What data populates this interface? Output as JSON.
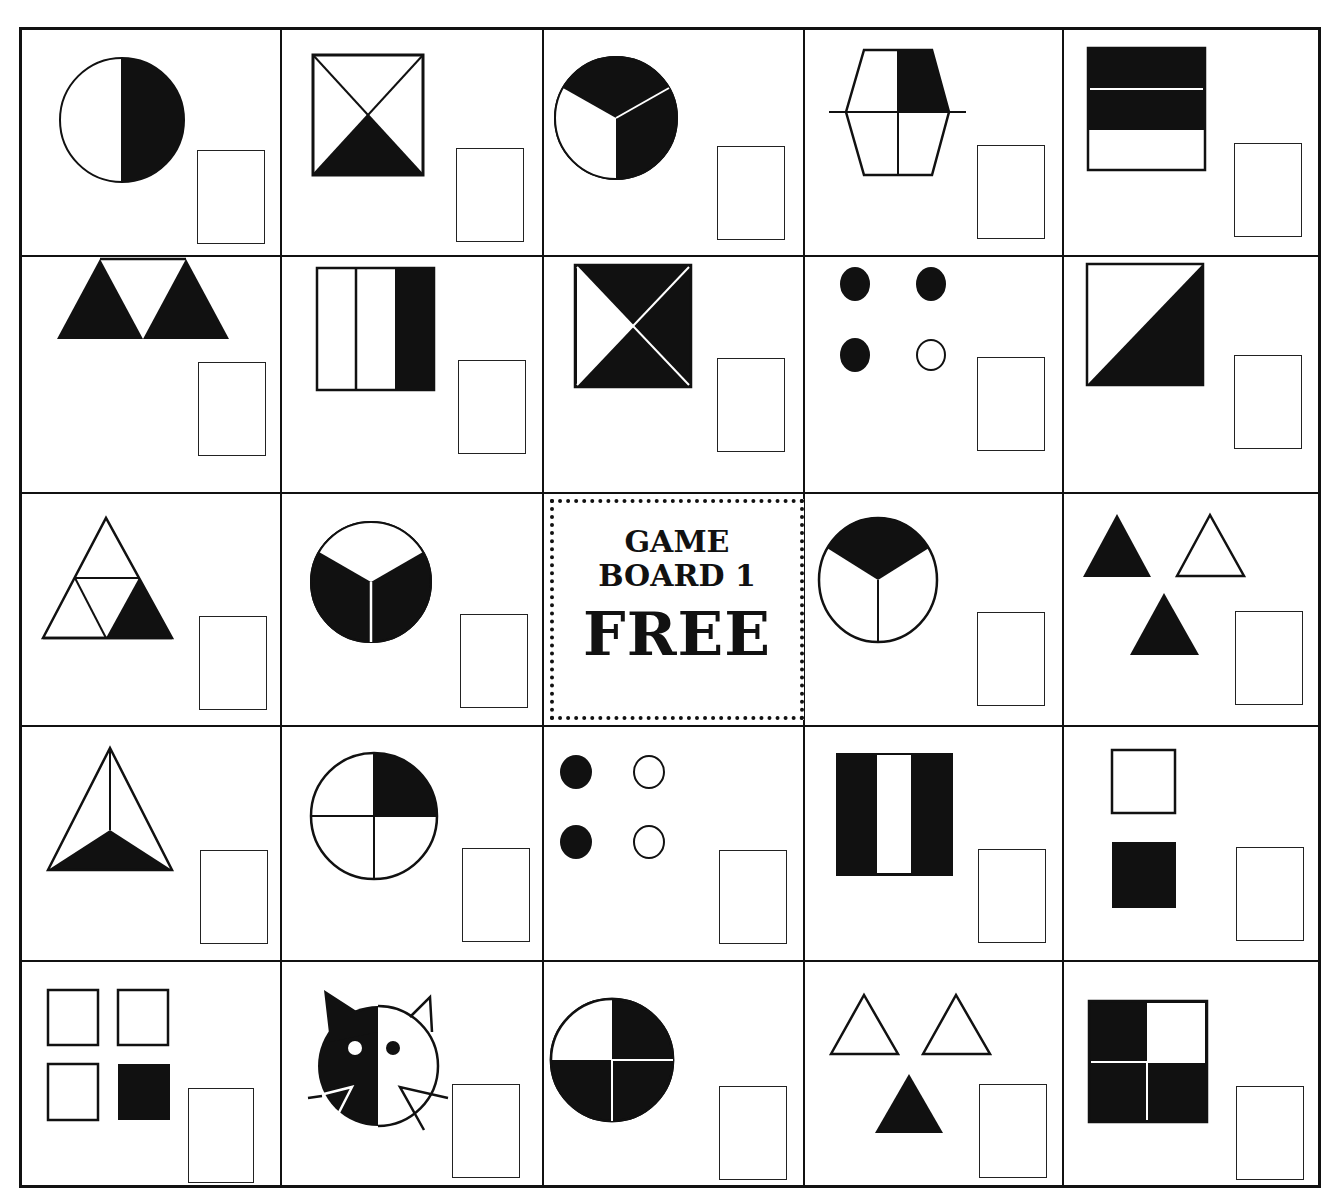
{
  "board": {
    "title_line1": "GAME",
    "title_line2": "BOARD 1",
    "free_label": "FREE",
    "rows": 5,
    "cols": 5,
    "colors": {
      "ink": "#111111",
      "paper": "#ffffff"
    }
  },
  "cells": [
    [
      {
        "shape": "circle-half",
        "fraction": "1/2",
        "description": "circle, right half shaded"
      },
      {
        "shape": "square-x-quarter",
        "fraction": "1/4",
        "description": "square split by diagonals, bottom triangle shaded"
      },
      {
        "shape": "circle-thirds-two",
        "fraction": "2/3",
        "description": "circle in thirds, two shaded"
      },
      {
        "shape": "hexagon-quarter",
        "fraction": "1/4",
        "description": "hexagon in quarters, top-right shaded"
      },
      {
        "shape": "rect-thirds-two",
        "fraction": "2/3",
        "description": "rectangle in horizontal thirds, top two shaded"
      }
    ],
    [
      {
        "shape": "trapezoid-triangles",
        "fraction": "2/3",
        "description": "three triangles, two shaded"
      },
      {
        "shape": "rect-vthirds-one",
        "fraction": "1/3",
        "description": "rectangle in vertical thirds, right shaded"
      },
      {
        "shape": "square-x-three",
        "fraction": "3/4",
        "description": "square split by diagonals, three shaded"
      },
      {
        "shape": "dots-three-of-four",
        "fraction": "3/4",
        "description": "four dots, three filled"
      },
      {
        "shape": "square-diagonal-half",
        "fraction": "1/2",
        "description": "square with diagonal, lower-right shaded"
      }
    ],
    [
      {
        "shape": "triangle-quarters",
        "fraction": "1/4",
        "description": "triangle in four, bottom-right shaded"
      },
      {
        "shape": "circle-thirds-two-bottom",
        "fraction": "2/3",
        "description": "circle in thirds, bottom two shaded"
      },
      {
        "shape": "free",
        "fraction": "",
        "description": "free space"
      },
      {
        "shape": "circle-thirds-one-top",
        "fraction": "1/3",
        "description": "circle in thirds, top shaded"
      },
      {
        "shape": "triangles-two-of-three",
        "fraction": "2/3",
        "description": "three triangles, two filled"
      }
    ],
    [
      {
        "shape": "triangle-thirds-one",
        "fraction": "1/3",
        "description": "triangle in thirds, bottom shaded"
      },
      {
        "shape": "circle-quarters-one",
        "fraction": "1/4",
        "description": "circle in quarters, top-right shaded"
      },
      {
        "shape": "dots-two-of-four",
        "fraction": "2/4",
        "description": "four dots, left two filled"
      },
      {
        "shape": "rect-vthirds-two",
        "fraction": "2/3",
        "description": "rectangle in vertical thirds, outer two shaded"
      },
      {
        "shape": "squares-one-of-two",
        "fraction": "1/2",
        "description": "two squares, bottom filled"
      }
    ],
    [
      {
        "shape": "squares-one-of-four",
        "fraction": "1/4",
        "description": "four squares, bottom-right filled"
      },
      {
        "shape": "cat-half",
        "fraction": "1/2",
        "description": "cat face, left half shaded"
      },
      {
        "shape": "circle-quarters-three",
        "fraction": "3/4",
        "description": "circle in quarters, three shaded"
      },
      {
        "shape": "triangles-one-of-three",
        "fraction": "1/3",
        "description": "three triangles, bottom filled"
      },
      {
        "shape": "square-quarters-three",
        "fraction": "3/4",
        "description": "square in quarters, three shaded"
      }
    ]
  ]
}
